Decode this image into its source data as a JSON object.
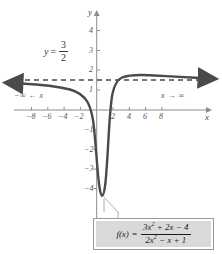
{
  "figure": {
    "background_color": "#ffffff",
    "curve_color": "#4a4a4a",
    "axis_color": "#8d8d8d",
    "asymptote_color": "#555555",
    "callout_fill": "#d9d9d9"
  },
  "axes": {
    "x_axis_name": "x",
    "y_axis_name": "y",
    "x_ticks": [
      "−8",
      "−6",
      "−4",
      "−2",
      "2",
      "4",
      "6",
      "8"
    ],
    "x_tick_values": [
      -8,
      -6,
      -4,
      -2,
      2,
      4,
      6,
      8
    ],
    "y_ticks": [
      "4",
      "3",
      "2",
      "1",
      "−1",
      "−2",
      "−3",
      "−4"
    ],
    "y_tick_values": [
      4,
      3,
      2,
      1,
      -1,
      -2,
      -3,
      -4
    ],
    "xlim": [
      -10.5,
      10.5
    ],
    "ylim": [
      -4.8,
      5.2
    ]
  },
  "annotations": {
    "asymptote_label": {
      "lhs": "y",
      "equals": "=",
      "numerator": "3",
      "denominator": "2"
    },
    "left_limit": "−∞ ← x",
    "right_limit": "x → ∞"
  },
  "formula": {
    "function_name": "f(x)",
    "equals": "=",
    "numerator_html": "3x<sup>2</sup> + 2x − 4",
    "denominator_html": "2x<sup>2</sup> − x + 1"
  },
  "chart_data": {
    "type": "line",
    "title": "",
    "xlabel": "x",
    "ylabel": "y",
    "xlim": [
      -10.5,
      10.5
    ],
    "ylim": [
      -4.8,
      5.2
    ],
    "grid": false,
    "legend": "none",
    "horizontal_asymptote": 1.5,
    "asymptote_label": "y = 3/2",
    "function_expression": "(3x^2 + 2x - 4)/(2x^2 - x + 1)",
    "annotations": [
      "−∞ ← x",
      "x → ∞",
      "y = 3/2"
    ],
    "series": [
      {
        "name": "f(x) = (3x^2 + 2x - 4)/(2x^2 - x + 1)",
        "x": [
          -10,
          -9,
          -8,
          -7,
          -6,
          -5,
          -4,
          -3,
          -2.5,
          -2,
          -1.8,
          -1.6,
          -1.4,
          -1.2,
          -1,
          -0.8,
          -0.6,
          -0.4,
          -0.2,
          0,
          0.2,
          0.4,
          0.6,
          0.8,
          1,
          1.2,
          1.4,
          1.6,
          1.8,
          2,
          2.5,
          3,
          4,
          5,
          6,
          7,
          8,
          9,
          10
        ],
        "y": [
          1.37,
          1.35,
          1.33,
          1.3,
          1.26,
          1.2,
          1.11,
          0.95,
          0.83,
          0.67,
          0.58,
          0.48,
          0.36,
          0.21,
          0.0,
          -0.28,
          -0.68,
          -1.25,
          -2.0,
          -4.0,
          -2.98,
          -1.19,
          -0.35,
          0.11,
          0.5,
          0.7,
          0.91,
          1.08,
          1.2,
          1.33,
          1.47,
          1.53,
          1.55,
          1.54,
          1.52,
          1.51,
          1.49,
          1.47,
          1.46
        ]
      },
      {
        "name": "asymptote",
        "style": "dashed",
        "x": [
          -10.5,
          10.5
        ],
        "y": [
          1.5,
          1.5
        ]
      }
    ]
  }
}
